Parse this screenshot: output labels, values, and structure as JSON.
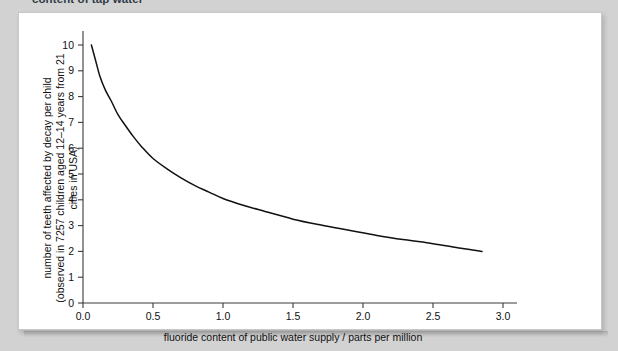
{
  "page": {
    "caption_partial": "content of tap water",
    "background_color": "#d2d2d2",
    "panel_color": "#ffffff"
  },
  "chart_data": {
    "type": "line",
    "title": "",
    "xlabel": "fluoride content of public water supply / parts per million",
    "ylabel_line1": "number of teeth affected by decay per child",
    "ylabel_line2": "(observed in 7257 children aged 12–14 years from 21",
    "ylabel_line3": "cities in USA)",
    "xlim": [
      0.0,
      3.0
    ],
    "ylim": [
      0,
      10
    ],
    "xticks": [
      "0.0",
      "0.5",
      "1.0",
      "1.5",
      "2.0",
      "2.5",
      "3.0"
    ],
    "xtick_values": [
      0.0,
      0.5,
      1.0,
      1.5,
      2.0,
      2.5,
      3.0
    ],
    "yticks": [
      "0",
      "1",
      "2",
      "3",
      "4",
      "5",
      "6",
      "7",
      "8",
      "9",
      "10"
    ],
    "ytick_values": [
      0,
      1,
      2,
      3,
      4,
      5,
      6,
      7,
      8,
      9,
      10
    ],
    "grid": false,
    "legend": false,
    "line_color": "#111111",
    "series": [
      {
        "name": "teeth affected by decay",
        "x": [
          0.06,
          0.09,
          0.12,
          0.16,
          0.2,
          0.25,
          0.3,
          0.36,
          0.42,
          0.5,
          0.6,
          0.7,
          0.8,
          0.9,
          1.0,
          1.15,
          1.3,
          1.5,
          1.7,
          1.9,
          2.1,
          2.3,
          2.5,
          2.7,
          2.85
        ],
        "values": [
          10.0,
          9.4,
          8.8,
          8.25,
          7.85,
          7.3,
          6.9,
          6.45,
          6.05,
          5.6,
          5.2,
          4.85,
          4.55,
          4.3,
          4.05,
          3.78,
          3.55,
          3.25,
          3.02,
          2.82,
          2.62,
          2.45,
          2.3,
          2.12,
          2.0
        ]
      }
    ]
  }
}
